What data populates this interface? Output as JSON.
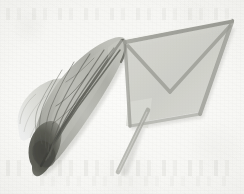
{
  "figure": {
    "title": "Insect wing specimen and triangular net frame",
    "medium": "scanned specimen plate",
    "width_px": 244,
    "height_px": 194,
    "background_color": "#f6f6f3",
    "paper_tone": "off-white textured paper"
  },
  "specimens": [
    {
      "id": "wing",
      "name": "insect wing",
      "position": "left",
      "orientation": "diagonal, base at lower-left, apex at upper-right",
      "fill_color": "#b9bab4",
      "vein_color": "#5a5b55",
      "base_color": "#4a4b46",
      "parts": [
        {
          "name": "forewing membrane",
          "tone": "medium grey, translucent"
        },
        {
          "name": "hindwing lobe",
          "tone": "pale grey, overlapping at left"
        },
        {
          "name": "wing base",
          "tone": "dark grey-black, opaque"
        },
        {
          "name": "longitudinal veins",
          "count": 7
        },
        {
          "name": "cross veins",
          "count": 3
        }
      ]
    },
    {
      "id": "net",
      "name": "triangular net frame with handle",
      "position": "right",
      "orientation": "triangle upper-right, handle angling to lower-left",
      "frame_color": "#9c9d96",
      "mesh_color": "#cfd0ca",
      "highlight_color": "#f2f2ee",
      "handle_color": "#a8a9a2",
      "parts": [
        {
          "name": "top rail",
          "tone": "light grey with bright highlight"
        },
        {
          "name": "mesh panel",
          "tone": "pale grey translucent fabric"
        },
        {
          "name": "diagonal brace",
          "tone": "medium grey bar forming inner V"
        },
        {
          "name": "lower rail",
          "tone": "medium grey"
        },
        {
          "name": "handle rod",
          "tone": "medium grey, tapering"
        }
      ]
    }
  ],
  "colors": {
    "background": "#f6f6f3",
    "wing_membrane": "#b9bab4",
    "wing_vein": "#5a5b55",
    "wing_base_dark": "#4a4b46",
    "net_frame": "#9c9d96",
    "net_mesh": "#cfd0ca",
    "highlight": "#f2f2ee",
    "shadow": "#8b8c85"
  }
}
